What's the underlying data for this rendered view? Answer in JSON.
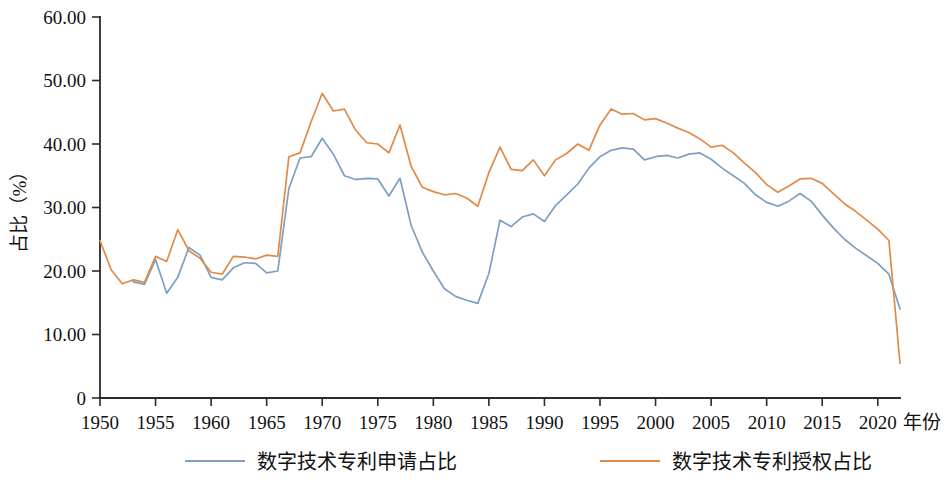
{
  "chart_data": {
    "type": "line",
    "title": "",
    "xlabel": "年份",
    "ylabel": "占比（%）",
    "xlim": [
      1950,
      2022
    ],
    "ylim": [
      0,
      60
    ],
    "grid": false,
    "legend_position": "bottom",
    "y_ticks": [
      "0",
      "10.00",
      "20.00",
      "30.00",
      "40.00",
      "50.00",
      "60.00"
    ],
    "y_tick_values": [
      0,
      10,
      20,
      30,
      40,
      50,
      60
    ],
    "x_ticks": [
      "1950",
      "1955",
      "1960",
      "1965",
      "1970",
      "1975",
      "1980",
      "1985",
      "1990",
      "1995",
      "2000",
      "2005",
      "2010",
      "2015",
      "2020"
    ],
    "x_tick_values": [
      1950,
      1955,
      1960,
      1965,
      1970,
      1975,
      1980,
      1985,
      1990,
      1995,
      2000,
      2005,
      2010,
      2015,
      2020
    ],
    "x": [
      1950,
      1951,
      1952,
      1953,
      1954,
      1955,
      1956,
      1957,
      1958,
      1959,
      1960,
      1961,
      1962,
      1963,
      1964,
      1965,
      1966,
      1967,
      1968,
      1969,
      1970,
      1971,
      1972,
      1973,
      1974,
      1975,
      1976,
      1977,
      1978,
      1979,
      1980,
      1981,
      1982,
      1983,
      1984,
      1985,
      1986,
      1987,
      1988,
      1989,
      1990,
      1991,
      1992,
      1993,
      1994,
      1995,
      1996,
      1997,
      1998,
      1999,
      2000,
      2001,
      2002,
      2003,
      2004,
      2005,
      2006,
      2007,
      2008,
      2009,
      2010,
      2011,
      2012,
      2013,
      2014,
      2015,
      2016,
      2017,
      2018,
      2019,
      2020,
      2021,
      2022
    ],
    "series": [
      {
        "name": "数字技术专利申请占比",
        "color": "#7d9fc2",
        "values": [
          null,
          null,
          null,
          18.3,
          17.9,
          21.8,
          16.5,
          19.0,
          23.7,
          22.5,
          19.0,
          18.6,
          20.5,
          21.3,
          21.2,
          19.7,
          20.0,
          33.0,
          37.8,
          38.0,
          40.9,
          38.4,
          35.0,
          34.4,
          34.6,
          34.5,
          31.8,
          34.6,
          27.2,
          23.0,
          20.0,
          17.2,
          16.0,
          15.4,
          14.9,
          19.6,
          28.0,
          27.0,
          28.5,
          29.0,
          27.8,
          30.3,
          32.0,
          33.7,
          36.2,
          38.0,
          39.0,
          39.4,
          39.2,
          37.5,
          38.0,
          38.2,
          37.8,
          38.4,
          38.6,
          37.6,
          36.2,
          35.0,
          33.8,
          32.0,
          30.8,
          30.2,
          31.0,
          32.2,
          31.0,
          28.8,
          26.8,
          25.0,
          23.6,
          22.4,
          21.2,
          19.5,
          14.0
        ]
      },
      {
        "name": "数字技术专利授权占比",
        "color": "#e08a4a",
        "values": [
          24.8,
          20.2,
          18.0,
          18.6,
          18.2,
          22.3,
          21.5,
          26.5,
          23.2,
          22.0,
          19.8,
          19.5,
          22.3,
          22.2,
          21.9,
          22.5,
          22.3,
          38.0,
          38.6,
          43.5,
          48.0,
          45.2,
          45.5,
          42.2,
          40.2,
          40.0,
          38.6,
          43.0,
          36.5,
          33.2,
          32.5,
          32.0,
          32.2,
          31.5,
          30.2,
          35.5,
          39.5,
          36.0,
          35.8,
          37.5,
          35.0,
          37.5,
          38.5,
          40.0,
          39.0,
          43.0,
          45.5,
          44.7,
          44.8,
          43.8,
          44.0,
          43.3,
          42.5,
          41.8,
          40.8,
          39.5,
          39.8,
          38.6,
          37.0,
          35.5,
          33.6,
          32.4,
          33.4,
          34.5,
          34.6,
          33.8,
          32.2,
          30.6,
          29.4,
          28.0,
          26.6,
          24.8,
          5.5
        ]
      }
    ]
  },
  "legend": {
    "items": [
      {
        "label": "数字技术专利申请占比",
        "color": "#7d9fc2"
      },
      {
        "label": "数字技术专利授权占比",
        "color": "#e08a4a"
      }
    ]
  },
  "axes": {
    "y_axis_title": "占比（%）",
    "x_axis_title": "年份"
  }
}
